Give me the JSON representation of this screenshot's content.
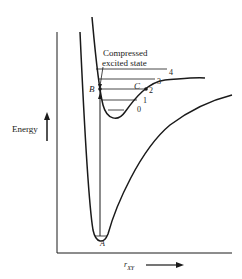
{
  "diagram": {
    "y_axis_label": "Energy",
    "x_axis_label": "r",
    "x_axis_subscript": "XY",
    "annotation": "Compressed excited state",
    "annotation_line1": "Compressed",
    "annotation_line2": "excited state",
    "points": {
      "A": "A",
      "B": "B",
      "C": "C"
    },
    "vibrational_levels": [
      "0",
      "1",
      "2",
      "3",
      "4"
    ],
    "colors": {
      "line": "#1a1a1a",
      "background": "#ffffff"
    }
  }
}
